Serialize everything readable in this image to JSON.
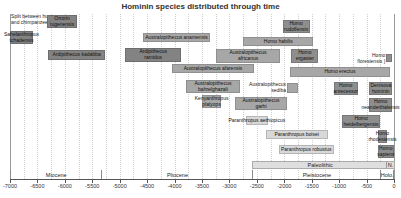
{
  "chart_data": {
    "type": "bar",
    "variant": "horizontal-timeline",
    "title": "Hominin species distributed through time",
    "x_unit": "thousands of years before present",
    "x_domain": [
      -7000,
      0
    ],
    "x_ticks": [
      "-7000",
      "-6500",
      "-6000",
      "-5500",
      "-5000",
      "-4500",
      "-4000",
      "-3500",
      "-3000",
      "-2500",
      "-2000",
      "-1500",
      "-1000",
      "-500",
      "0"
    ],
    "x_tick_values": [
      -7000,
      -6500,
      -6000,
      -5500,
      -5000,
      -4500,
      -4000,
      -3500,
      -3000,
      -2500,
      -2000,
      -1500,
      -1000,
      -500,
      0
    ],
    "gridline_step": 250,
    "legend": "none",
    "annotation": {
      "lines": [
        "Split between humans",
        "and chimpanzees"
      ],
      "x": -6980,
      "y": 1
    },
    "species": [
      {
        "name": "orrorin-tugenensis",
        "lines": [
          "Orrorin",
          "tugenensis"
        ],
        "start": -6320,
        "end": -5780,
        "y": 2,
        "h": 13,
        "color": "dark",
        "label": "in"
      },
      {
        "name": "homo-rudolfensis",
        "lines": [
          "Homo",
          "rudolfensis"
        ],
        "start": -2030,
        "end": -1540,
        "y": 7,
        "h": 13,
        "color": "homo",
        "label": "in"
      },
      {
        "name": "sahelanthropus-tchadensis",
        "lines": [
          "Sahelanthropus",
          "tchadensis"
        ],
        "start": -7000,
        "end": -6580,
        "y": 18,
        "h": 13,
        "color": "dark",
        "label": "in"
      },
      {
        "name": "australopithecus-anamensis",
        "lines": [
          "Australopithecus anamensis"
        ],
        "start": -4580,
        "end": -3350,
        "y": 20,
        "h": 9,
        "color": "med",
        "label": "in"
      },
      {
        "name": "homo-habilis",
        "lines": [
          "Homo habilis"
        ],
        "start": -2750,
        "end": -1470,
        "y": 24,
        "h": 9,
        "color": "med",
        "label": "in"
      },
      {
        "name": "ardipithecus-ramidus",
        "lines": [
          "Ardipithecus",
          "ramidus"
        ],
        "start": -4900,
        "end": -3880,
        "y": 35,
        "h": 14,
        "color": "dark",
        "label": "in"
      },
      {
        "name": "ardipithecus-kadabba",
        "lines": [
          "Ardipithecus kadabba"
        ],
        "start": -6300,
        "end": -5270,
        "y": 37,
        "h": 10,
        "color": "dark",
        "label": "in"
      },
      {
        "name": "australopithecus-africanus",
        "lines": [
          "Australopithecus",
          "africanus"
        ],
        "start": -3250,
        "end": -2070,
        "y": 36,
        "h": 14,
        "color": "med",
        "label": "in"
      },
      {
        "name": "homo-ergaster",
        "lines": [
          "Homo",
          "ergaster"
        ],
        "start": -1870,
        "end": -1380,
        "y": 36,
        "h": 14,
        "color": "homo",
        "label": "in"
      },
      {
        "name": "homo-floresiensis",
        "lines": [
          "Homo",
          "floresiensis"
        ],
        "start": -140,
        "end": -30,
        "y": 41,
        "h": 8,
        "color": "homo",
        "label": "left",
        "bracket": "}"
      },
      {
        "name": "australopithecus-afarensis",
        "lines": [
          "Australopithecus afarensis"
        ],
        "start": -4050,
        "end": -2550,
        "y": 51,
        "h": 9,
        "color": "med",
        "label": "in"
      },
      {
        "name": "homo-erectus",
        "lines": [
          "Homo erectus"
        ],
        "start": -1890,
        "end": -80,
        "y": 54,
        "h": 10,
        "color": "med",
        "label": "in"
      },
      {
        "name": "australopithecus-bahrelghazali",
        "lines": [
          "Australopithecus",
          "bahrelghazali"
        ],
        "start": -3800,
        "end": -2800,
        "y": 67,
        "h": 13,
        "color": "med",
        "label": "in"
      },
      {
        "name": "australopithecus-sediba",
        "lines": [
          "Australopithecus",
          "sediba"
        ],
        "start": -1950,
        "end": -1750,
        "y": 70,
        "h": 10,
        "color": "med",
        "label": "left"
      },
      {
        "name": "homo-antecessor",
        "lines": [
          "Homo",
          "antecessor"
        ],
        "start": -1100,
        "end": -660,
        "y": 69,
        "h": 13,
        "color": "homo",
        "label": "in"
      },
      {
        "name": "denisova-hominin",
        "lines": [
          "Denisova",
          "hominin"
        ],
        "start": -450,
        "end": -30,
        "y": 69,
        "h": 13,
        "color": "homo",
        "label": "in"
      },
      {
        "name": "kenyanthropus-platyops",
        "lines": [
          "Kenyanthropus",
          "platyops"
        ],
        "start": -3500,
        "end": -3150,
        "y": 82,
        "h": 13,
        "color": "med",
        "label": "in"
      },
      {
        "name": "australopithecus-garhi",
        "lines": [
          "Australopithecus",
          "garhi"
        ],
        "start": -2900,
        "end": -1950,
        "y": 84,
        "h": 13,
        "color": "med",
        "label": "in"
      },
      {
        "name": "homo-neanderthalensis",
        "lines": [
          "Homo",
          "neanderthalensis"
        ],
        "start": -450,
        "end": -40,
        "y": 85,
        "h": 14,
        "color": "homo",
        "label": "in"
      },
      {
        "name": "paranthropus-aethiopicus",
        "lines": [
          "Paranthropus aethiopicus"
        ],
        "start": -2700,
        "end": -2300,
        "y": 103,
        "h": 9,
        "color": "light",
        "label": "in"
      },
      {
        "name": "homo-heidelbergensis",
        "lines": [
          "Homo",
          "heidelbergensis"
        ],
        "start": -950,
        "end": -250,
        "y": 102,
        "h": 13,
        "color": "homo",
        "label": "in"
      },
      {
        "name": "paranthropus-boisei",
        "lines": [
          "Paranthropus boisei"
        ],
        "start": -2340,
        "end": -1210,
        "y": 117,
        "h": 9,
        "color": "light",
        "label": "in"
      },
      {
        "name": "homo-rhodesiensis",
        "lines": [
          "Homo",
          "rhodesiensis"
        ],
        "start": -300,
        "end": -120,
        "y": 117,
        "h": 13,
        "color": "homo",
        "label": "in"
      },
      {
        "name": "paranthropus-robustus",
        "lines": [
          "Paranthropus robustus"
        ],
        "start": -2100,
        "end": -1100,
        "y": 132,
        "h": 9,
        "color": "light",
        "label": "in"
      },
      {
        "name": "homo-sapiens",
        "lines": [
          "Homo",
          "sapiens"
        ],
        "start": -300,
        "end": 0,
        "y": 132,
        "h": 13,
        "color": "homo",
        "label": "in"
      }
    ],
    "paleolithic_band": {
      "label": "Paleolithic",
      "n_label": "N.",
      "start": -2580,
      "n_start": -130,
      "end": 0,
      "y": 148,
      "h": 8
    },
    "epochs": [
      {
        "label": "Miocene",
        "start": -7000,
        "end": -5333
      },
      {
        "label": "Pliocene",
        "start": -5333,
        "end": -2580
      },
      {
        "label": "Pleistocene",
        "start": -2580,
        "end": -250
      },
      {
        "label": "Holo.",
        "start": -250,
        "end": 0
      }
    ],
    "layout": {
      "plot_left": 10,
      "plot_top": 13,
      "plot_width": 385,
      "grid_top": 1,
      "grid_bottom": 166,
      "epoch_y": 157,
      "epoch_h": 9,
      "axis_y": 166,
      "tick_label_y": 170
    },
    "colors": {
      "dark": "#838383",
      "med": "#a7a7a7",
      "homo": "#8e8e8e",
      "light": "#d8d8d8",
      "grid": "#cfcfcf",
      "axis": "#555555",
      "title": "#333333"
    }
  }
}
